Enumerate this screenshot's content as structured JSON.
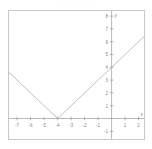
{
  "header": {
    "clipped_text": "· · ·   ·  ·"
  },
  "chart_data": {
    "type": "line",
    "title": "",
    "subtitle": "",
    "xlabel": "x",
    "ylabel": "y",
    "xlim": [
      -7.6,
      2.4
    ],
    "ylim": [
      -1.6,
      8.4
    ],
    "grid": false,
    "legend": null,
    "x_ticks": [
      -7,
      -6,
      -5,
      -4,
      -3,
      -2,
      -1,
      1,
      2
    ],
    "x_tick_labels": [
      "-7",
      "-6",
      "-5",
      "-4",
      "-3",
      "-2",
      "-1",
      "1",
      "2"
    ],
    "y_ticks": [
      -1,
      1,
      2,
      3,
      4,
      5,
      6,
      7,
      8
    ],
    "y_tick_labels": [
      "-1",
      "1",
      "2",
      "3",
      "4",
      "5",
      "6",
      "7",
      "8"
    ],
    "series": [
      {
        "name": "y = |x + 4|",
        "color": "#b0b0b0",
        "x": [
          -7.6,
          -4,
          2.4
        ],
        "values": [
          3.6,
          0,
          6.4
        ]
      }
    ],
    "annotations": [
      {
        "label": "vertex",
        "x": -4,
        "y": 0
      },
      {
        "label": "y-intercept",
        "x": 0,
        "y": 4
      }
    ],
    "axis_color": "#9a9a9a",
    "frame_color": "#c8c8c8",
    "line_color": "#b0b0b0"
  }
}
